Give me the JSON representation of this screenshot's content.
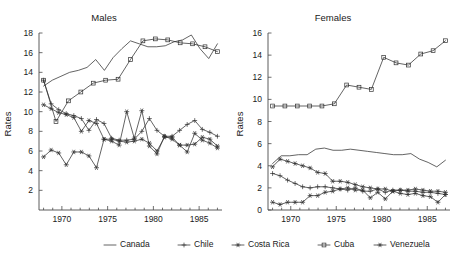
{
  "figure": {
    "background": "#ffffff",
    "line_color": "#303030",
    "axis_color": "#4a4a4a"
  },
  "panels": [
    {
      "key": "males",
      "title": "Males",
      "ylabel": "Rates"
    },
    {
      "key": "females",
      "title": "Females",
      "ylabel": "Rates"
    }
  ],
  "legend": {
    "position": "bottom-center",
    "entries": [
      {
        "label": "Canada",
        "marker": "none",
        "marker_name": "line-marker-canada"
      },
      {
        "label": "Chile",
        "marker": "plus",
        "marker_name": "plus-marker-chile"
      },
      {
        "label": "Costa Rica",
        "marker": "star",
        "marker_name": "star-marker-costa-rica"
      },
      {
        "label": "Cuba",
        "marker": "square",
        "marker_name": "square-marker-cuba"
      },
      {
        "label": "Venezuela",
        "marker": "star",
        "marker_name": "star-marker-venezuela"
      }
    ]
  },
  "chart_data": [
    {
      "type": "line",
      "title": "Males",
      "xlabel": "",
      "ylabel": "Rates",
      "xlim": [
        1967.5,
        1987.5
      ],
      "ylim": [
        0,
        18
      ],
      "xticks": [
        1970,
        1975,
        1980,
        1985
      ],
      "yticks": [
        2,
        4,
        6,
        8,
        10,
        12,
        14,
        16,
        18
      ],
      "xtick_labels": [
        "1970",
        "1975",
        "1980",
        "1985"
      ],
      "ytick_labels": [
        "2",
        "4",
        "6",
        "8",
        "10",
        "12",
        "14",
        "16",
        "18"
      ],
      "minor_xticks": [
        1968,
        1969,
        1971,
        1972,
        1973,
        1974,
        1976,
        1977,
        1978,
        1979,
        1981,
        1982,
        1983,
        1984,
        1986,
        1987
      ],
      "grid": false,
      "legend_position": "bottom-center",
      "series": [
        {
          "name": "Canada",
          "marker": "none",
          "x": [
            1968,
            1969,
            1970,
            1971,
            1972,
            1973,
            1974,
            1975,
            1976,
            1977,
            1978,
            1979,
            1980,
            1981,
            1982,
            1983,
            1984,
            1985,
            1986,
            1987
          ],
          "values": [
            12.6,
            13.2,
            13.6,
            14.0,
            14.2,
            14.5,
            15.3,
            14.2,
            15.5,
            16.4,
            17.2,
            16.9,
            16.6,
            16.6,
            16.7,
            17.1,
            17.3,
            17.8,
            16.4,
            15.4,
            16.9
          ]
        },
        {
          "name": "Cuba",
          "marker": "square",
          "x": [
            1968,
            1969,
            1970,
            1971,
            1972,
            1973,
            1974,
            1975,
            1976,
            1977,
            1978
          ],
          "values": [
            13.2,
            9.0,
            11.1,
            12.0,
            12.9,
            13.2,
            13.3,
            15.3,
            17.2,
            17.4,
            17.3,
            17.0,
            16.9,
            16.6,
            16.1
          ]
        },
        {
          "name": "Chile",
          "marker": "plus",
          "x": [
            1968,
            1969,
            1970,
            1971,
            1972,
            1973,
            1974,
            1975,
            1976,
            1977,
            1978,
            1979,
            1980,
            1981,
            1982,
            1983,
            1984,
            1985,
            1986,
            1987
          ],
          "values": [
            13.2,
            10.8,
            10.2,
            9.8,
            9.6,
            9.3,
            8.1,
            9.2,
            8.8,
            7.3,
            7.1,
            7.1,
            7.2,
            8.0,
            9.3,
            8.1,
            7.5,
            7.5,
            8.1,
            8.7,
            9.1,
            8.2,
            7.9,
            7.5
          ]
        },
        {
          "name": "Costa Rica",
          "marker": "star",
          "x": [
            1968,
            1969,
            1970,
            1971,
            1972,
            1973,
            1974,
            1975,
            1976,
            1977,
            1978,
            1979,
            1980,
            1981,
            1982,
            1983,
            1984,
            1985,
            1986,
            1987
          ],
          "values": [
            5.4,
            6.1,
            5.8,
            4.6,
            5.9,
            5.9,
            5.5,
            4.3,
            7.2,
            7.0,
            6.6,
            10.0,
            7.3,
            10.1,
            6.5,
            5.7,
            7.5,
            7.2,
            6.6,
            5.9,
            7.8,
            7.1,
            6.8,
            6.3
          ]
        },
        {
          "name": "Venezuela",
          "marker": "star",
          "x": [
            1968,
            1969,
            1970,
            1971,
            1972,
            1973,
            1974,
            1975,
            1976,
            1977,
            1978,
            1979,
            1980,
            1981,
            1982,
            1983,
            1984,
            1985,
            1986,
            1987
          ],
          "values": [
            10.7,
            10.3,
            9.9,
            9.7,
            9.4,
            8.0,
            9.1,
            8.8,
            7.2,
            7.2,
            7.0,
            6.9,
            7.0,
            7.2,
            6.8,
            6.0,
            7.4,
            7.4,
            6.6,
            6.6,
            6.7,
            7.4,
            7.2,
            6.5
          ]
        }
      ]
    },
    {
      "type": "line",
      "title": "Females",
      "xlabel": "",
      "ylabel": "Rates",
      "xlim": [
        1967.5,
        1987.5
      ],
      "ylim": [
        0,
        16
      ],
      "xticks": [
        1970,
        1975,
        1980,
        1985
      ],
      "yticks": [
        0,
        2,
        4,
        6,
        8,
        10,
        12,
        14,
        16
      ],
      "xtick_labels": [
        "1970",
        "1975",
        "1980",
        "1985"
      ],
      "ytick_labels": [
        "0",
        "2",
        "4",
        "6",
        "8",
        "10",
        "12",
        "14",
        "16"
      ],
      "minor_xticks": [
        1968,
        1969,
        1971,
        1972,
        1973,
        1974,
        1976,
        1977,
        1978,
        1979,
        1981,
        1982,
        1983,
        1984,
        1986,
        1987
      ],
      "grid": false,
      "legend_position": "bottom-center",
      "series": [
        {
          "name": "Cuba",
          "marker": "square",
          "x": [
            1968,
            1969,
            1970,
            1971,
            1972,
            1973,
            1974,
            1975,
            1976,
            1977,
            1978
          ],
          "values": [
            9.4,
            9.4,
            9.4,
            9.4,
            9.4,
            9.6,
            11.3,
            11.1,
            10.9,
            13.8,
            13.3,
            13.1,
            14.1,
            14.4,
            15.3
          ]
        },
        {
          "name": "Canada",
          "marker": "none",
          "x": [
            1968,
            1969,
            1970,
            1971,
            1972,
            1973,
            1974,
            1975,
            1976,
            1977,
            1978,
            1979,
            1980,
            1981,
            1982,
            1983,
            1984,
            1985,
            1986,
            1987
          ],
          "values": [
            4.2,
            4.9,
            4.9,
            5.0,
            5.0,
            5.5,
            5.6,
            5.4,
            5.4,
            5.5,
            5.4,
            5.3,
            5.2,
            5.1,
            5.0,
            5.0,
            5.1,
            4.6,
            4.3,
            3.9,
            4.5
          ]
        },
        {
          "name": "Venezuela",
          "marker": "star",
          "x": [
            1968,
            1969,
            1970,
            1971,
            1972,
            1973,
            1974,
            1975,
            1976,
            1977,
            1978,
            1979,
            1980,
            1981,
            1982,
            1983,
            1984,
            1985,
            1986,
            1987
          ],
          "values": [
            3.9,
            4.6,
            4.4,
            4.2,
            4.0,
            3.8,
            3.4,
            3.3,
            2.6,
            2.6,
            2.5,
            2.3,
            2.1,
            2.0,
            1.9,
            1.9,
            1.7,
            1.8,
            1.8,
            1.9,
            1.8,
            1.7,
            1.7,
            1.6
          ]
        },
        {
          "name": "Chile",
          "marker": "plus",
          "x": [
            1968,
            1969,
            1970,
            1971,
            1972,
            1973,
            1974,
            1975,
            1976,
            1977,
            1978,
            1979,
            1980,
            1981,
            1982,
            1983,
            1984,
            1985,
            1986,
            1987
          ],
          "values": [
            3.3,
            3.1,
            2.7,
            2.4,
            2.1,
            2.0,
            2.1,
            2.1,
            2.0,
            1.9,
            1.8,
            2.0,
            1.7,
            1.7,
            1.9,
            1.6,
            1.8,
            1.8,
            1.7,
            1.7,
            1.6,
            1.6,
            1.5,
            1.4
          ]
        },
        {
          "name": "Costa Rica",
          "marker": "star",
          "x": [
            1968,
            1969,
            1970,
            1971,
            1972,
            1973,
            1974,
            1975,
            1976,
            1977,
            1978,
            1979,
            1980,
            1981,
            1982,
            1983,
            1984,
            1985,
            1986,
            1987
          ],
          "values": [
            0.7,
            0.5,
            0.7,
            0.7,
            0.7,
            1.3,
            1.3,
            1.6,
            1.7,
            1.9,
            2.0,
            1.8,
            1.8,
            1.1,
            1.6,
            1.0,
            1.7,
            1.5,
            1.4,
            1.5,
            1.3,
            1.2,
            0.7,
            1.4
          ]
        }
      ]
    }
  ]
}
